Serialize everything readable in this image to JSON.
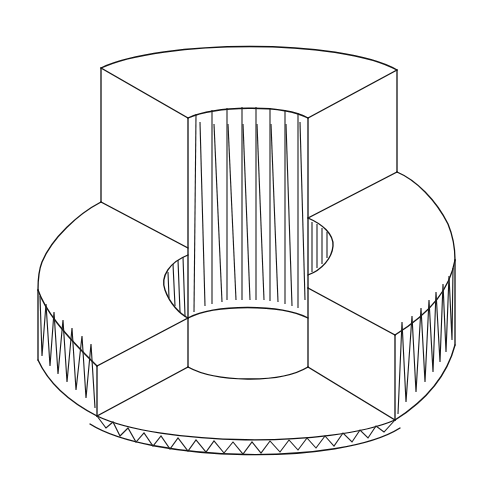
{
  "figure": {
    "title": "Isometric line drawing of a cut-away flanged cylindrical part with central bore",
    "kind": "isometric-section-view",
    "line_color": "#111111",
    "background": "#ffffff"
  },
  "parts": {
    "upper_boss": "Upper cylindrical boss with 90-degree cut-out quadrant",
    "central_bore": "Central cylindrical bore with vertical ruled shading",
    "lower_flange": "Lower circular flange with cut-out quadrant",
    "flange_rim_hatch": "Zig-zag ruled shading on flange outer rim",
    "bottom_rim_hatch": "Triangular ruled hatching on front bottom edge"
  }
}
